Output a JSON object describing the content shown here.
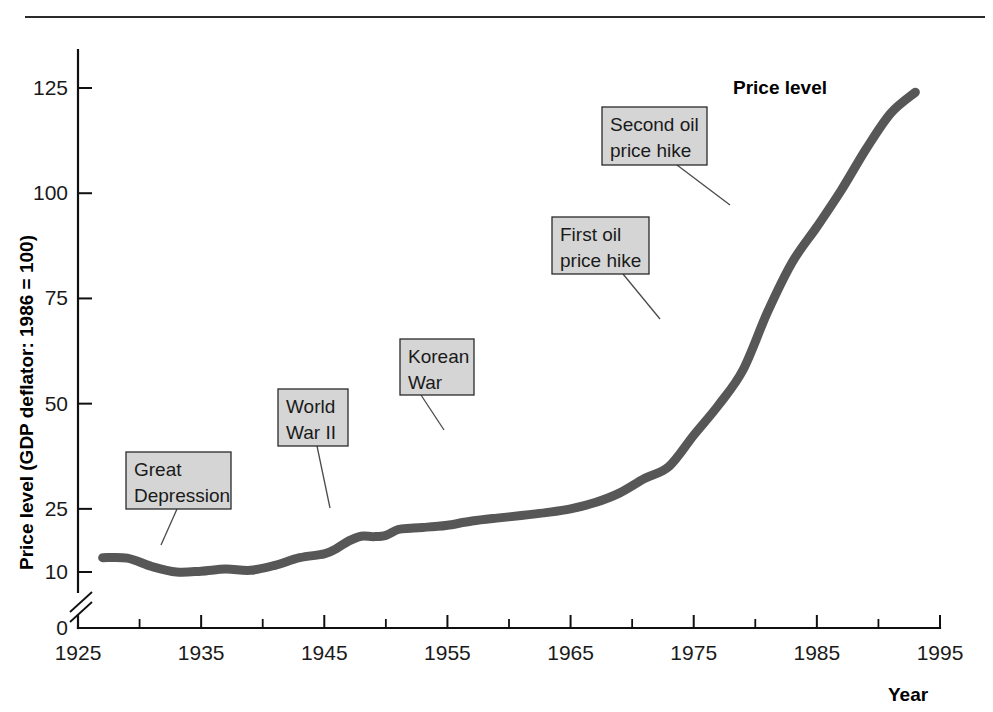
{
  "figure": {
    "background_color": "#ffffff",
    "rule_color": "#2b2b2b",
    "has_top_rule": true
  },
  "chart_data": {
    "type": "line",
    "title": "",
    "subtitle": "",
    "xlabel": "Year",
    "ylabel": "Price level (GDP deflator: 1986 = 100)",
    "series_label": "Price level",
    "line_color": "#575757",
    "xlim": [
      1925,
      1995
    ],
    "ylim": [
      0,
      137
    ],
    "y_axis_break": {
      "present": true,
      "from": 0,
      "to": 10
    },
    "grid": false,
    "legend": "none",
    "xticks": [
      1925,
      1935,
      1945,
      1955,
      1965,
      1975,
      1985,
      1995
    ],
    "xtick_labels": [
      "1925",
      "1935",
      "1945",
      "1955",
      "1965",
      "1975",
      "1985",
      "1995"
    ],
    "xminorticks": [
      1930,
      1940,
      1950,
      1960,
      1970,
      1980,
      1990
    ],
    "yticks": [
      0,
      10,
      25,
      50,
      75,
      100,
      125
    ],
    "ytick_labels": [
      "0",
      "10",
      "25",
      "50",
      "75",
      "100",
      "125"
    ],
    "x": [
      1927,
      1929,
      1931,
      1933,
      1935,
      1937,
      1939,
      1941,
      1943,
      1945,
      1946,
      1947,
      1948,
      1949,
      1950,
      1951,
      1952,
      1953,
      1954,
      1955,
      1957,
      1959,
      1961,
      1963,
      1965,
      1967,
      1969,
      1971,
      1973,
      1975,
      1977,
      1979,
      1981,
      1983,
      1985,
      1987,
      1989,
      1991,
      1993
    ],
    "values": [
      13.4,
      13.3,
      11.3,
      10.0,
      10.2,
      10.7,
      10.4,
      11.6,
      13.4,
      14.3,
      15.6,
      17.4,
      18.5,
      18.4,
      18.7,
      20.1,
      20.4,
      20.6,
      20.8,
      21.1,
      22.1,
      22.8,
      23.4,
      24.1,
      25.0,
      26.5,
      28.8,
      32.2,
      35.1,
      42.5,
      49.6,
      58.0,
      71.8,
      83.6,
      92.0,
      100.8,
      110.5,
      119.0,
      124.0
    ],
    "annotations": [
      {
        "label": "Great Depression",
        "lines": [
          "Great",
          "Depression"
        ],
        "point_year": 1931,
        "point_value": 11.8
      },
      {
        "label": "World War II",
        "lines": [
          "World",
          "War II"
        ],
        "point_year": 1942,
        "point_value": 12.4
      },
      {
        "label": "Korean War",
        "lines": [
          "Korean",
          "War"
        ],
        "point_year": 1951,
        "point_value": 20.0
      },
      {
        "label": "First oil price hike",
        "lines": [
          "First oil",
          "price hike"
        ],
        "point_year": 1974,
        "point_value": 39.0
      },
      {
        "label": "Second oil price hike",
        "lines": [
          "Second oil",
          "price hike"
        ],
        "point_year": 1979,
        "point_value": 58.0
      }
    ]
  },
  "annotation_boxes": [
    {
      "name": "great-depression",
      "lines": [
        "Great",
        "Depression"
      ],
      "x": 126,
      "y": 452,
      "w": 105,
      "h": 57,
      "tail_x": 177,
      "tail_y": 509,
      "point_x": 161,
      "point_y": 545
    },
    {
      "name": "world-war-ii",
      "lines": [
        "World",
        "War II"
      ],
      "x": 278,
      "y": 389,
      "w": 70,
      "h": 57,
      "tail_x": 317,
      "tail_y": 446,
      "point_x": 330,
      "point_y": 508
    },
    {
      "name": "korean-war",
      "lines": [
        "Korean",
        "War"
      ],
      "x": 400,
      "y": 339,
      "w": 74,
      "h": 56,
      "tail_x": 421,
      "tail_y": 395,
      "point_x": 444,
      "point_y": 430
    },
    {
      "name": "first-oil-price-hike",
      "lines": [
        "First oil",
        "price hike"
      ],
      "x": 552,
      "y": 217,
      "w": 97,
      "h": 57,
      "tail_x": 623,
      "tail_y": 274,
      "point_x": 660,
      "point_y": 319
    },
    {
      "name": "second-oil-price-hike",
      "lines": [
        "Second oil",
        "price hike"
      ],
      "x": 602,
      "y": 107,
      "w": 105,
      "h": 58,
      "tail_x": 677,
      "tail_y": 165,
      "point_x": 730,
      "point_y": 205
    }
  ],
  "series_label": {
    "text": "Price level",
    "x": 733,
    "y": 94
  },
  "axis_titles": {
    "y": "Price level (GDP deflator: 1986 = 100)",
    "x": "Year"
  }
}
